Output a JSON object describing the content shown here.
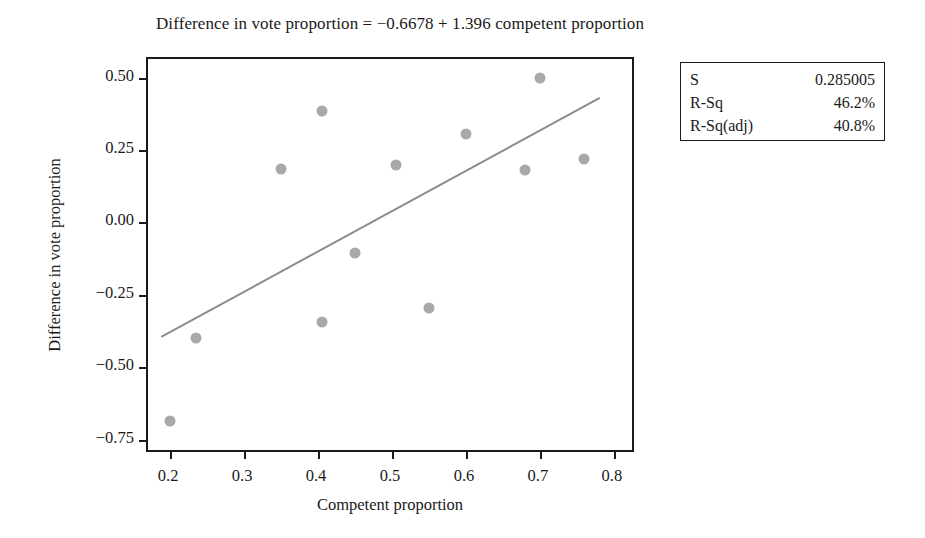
{
  "chart_data": {
    "type": "scatter",
    "title": "Difference in vote proportion = −0.6678 + 1.396 competent proportion",
    "xlabel": "Competent proportion",
    "ylabel": "Difference in vote proportion",
    "xlim": [
      0.17,
      0.83
    ],
    "ylim": [
      -0.8,
      0.565
    ],
    "xticks": [
      "0.2",
      "0.3",
      "0.4",
      "0.5",
      "0.6",
      "0.7",
      "0.8"
    ],
    "xtick_values": [
      0.2,
      0.3,
      0.4,
      0.5,
      0.6,
      0.7,
      0.8
    ],
    "yticks": [
      "0.50",
      "0.25",
      "0.00",
      "−0.25",
      "−0.50",
      "−0.75"
    ],
    "ytick_values": [
      0.5,
      0.25,
      0.0,
      -0.25,
      -0.5,
      -0.75
    ],
    "grid": false,
    "legend": false,
    "marker_color": "#a9a9a9",
    "line_color": "#8c8c8c",
    "points": [
      {
        "x": 0.2,
        "y": -0.685
      },
      {
        "x": 0.235,
        "y": -0.4
      },
      {
        "x": 0.35,
        "y": 0.185
      },
      {
        "x": 0.405,
        "y": 0.385
      },
      {
        "x": 0.405,
        "y": -0.345
      },
      {
        "x": 0.45,
        "y": -0.105
      },
      {
        "x": 0.505,
        "y": 0.2
      },
      {
        "x": 0.55,
        "y": -0.295
      },
      {
        "x": 0.6,
        "y": 0.305
      },
      {
        "x": 0.68,
        "y": 0.18
      },
      {
        "x": 0.7,
        "y": 0.5
      },
      {
        "x": 0.76,
        "y": 0.22
      }
    ],
    "fit": {
      "intercept": -0.6678,
      "slope": 1.396,
      "x_start": 0.188,
      "x_end": 0.786,
      "equation": "Difference in vote proportion = −0.6678 + 1.396 competent proportion"
    },
    "stats": [
      {
        "key": "S",
        "value": "0.285005"
      },
      {
        "key": "R-Sq",
        "value": "46.2%"
      },
      {
        "key": "R-Sq(adj)",
        "value": "40.8%"
      }
    ]
  }
}
